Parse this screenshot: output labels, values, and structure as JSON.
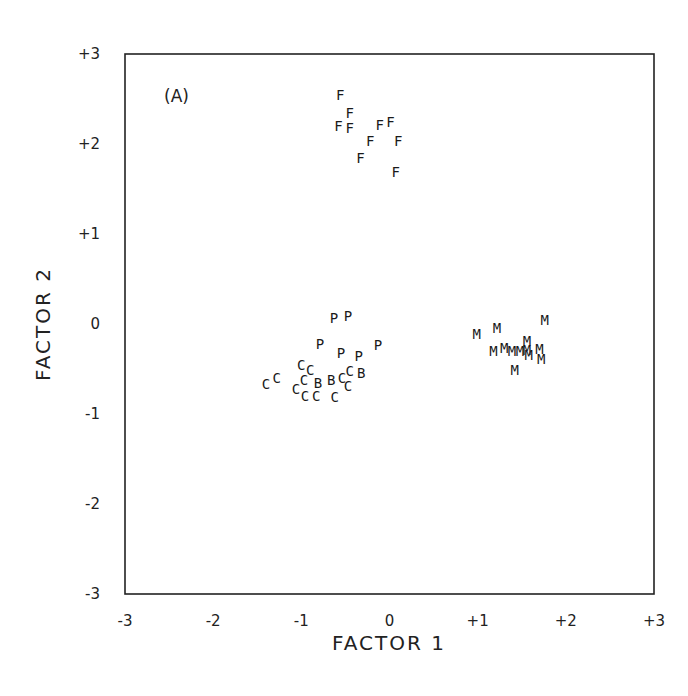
{
  "chart_data": {
    "type": "scatter",
    "title": "",
    "panel_label": "(A)",
    "xlabel": "FACTOR 1",
    "ylabel": "FACTOR 2",
    "xlim": [
      -3,
      3
    ],
    "ylim": [
      -3,
      3
    ],
    "xticks": [
      "-3",
      "-2",
      "-1",
      "0",
      "+1",
      "+2",
      "+3"
    ],
    "yticks": [
      "+3",
      "+2",
      "+1",
      "0",
      "-1",
      "-2",
      "-3"
    ],
    "grid": false,
    "legend": null,
    "marker_style": "letter",
    "series": [
      {
        "name": "F",
        "marker": "F",
        "points": [
          [
            -0.56,
            2.55
          ],
          [
            -0.45,
            2.34
          ],
          [
            -0.58,
            2.2
          ],
          [
            -0.45,
            2.18
          ],
          [
            -0.11,
            2.21
          ],
          [
            0.01,
            2.25
          ],
          [
            -0.22,
            2.03
          ],
          [
            0.1,
            2.03
          ],
          [
            -0.33,
            1.85
          ],
          [
            0.07,
            1.69
          ]
        ]
      },
      {
        "name": "P",
        "marker": "P",
        "points": [
          [
            -0.63,
            0.07
          ],
          [
            -0.47,
            0.09
          ],
          [
            -0.79,
            -0.22
          ],
          [
            -0.55,
            -0.32
          ],
          [
            -0.35,
            -0.35
          ],
          [
            -0.13,
            -0.23
          ]
        ]
      },
      {
        "name": "C",
        "marker": "C",
        "points": [
          [
            -1.4,
            -0.67
          ],
          [
            -1.28,
            -0.6
          ],
          [
            -1.0,
            -0.45
          ],
          [
            -0.9,
            -0.51
          ],
          [
            -0.97,
            -0.62
          ],
          [
            -1.06,
            -0.72
          ],
          [
            -0.96,
            -0.8
          ],
          [
            -0.83,
            -0.8
          ],
          [
            -0.54,
            -0.6
          ],
          [
            -0.47,
            -0.69
          ],
          [
            -0.45,
            -0.52
          ],
          [
            -0.62,
            -0.81
          ]
        ]
      },
      {
        "name": "B",
        "marker": "B",
        "points": [
          [
            -0.81,
            -0.65
          ],
          [
            -0.66,
            -0.62
          ],
          [
            -0.32,
            -0.54
          ]
        ]
      },
      {
        "name": "M",
        "marker": "M",
        "points": [
          [
            0.99,
            -0.11
          ],
          [
            1.22,
            -0.04
          ],
          [
            1.76,
            0.04
          ],
          [
            1.18,
            -0.3
          ],
          [
            1.3,
            -0.27
          ],
          [
            1.39,
            -0.3
          ],
          [
            1.48,
            -0.3
          ],
          [
            1.56,
            -0.29
          ],
          [
            1.56,
            -0.19
          ],
          [
            1.58,
            -0.34
          ],
          [
            1.7,
            -0.28
          ],
          [
            1.72,
            -0.39
          ],
          [
            1.42,
            -0.51
          ]
        ]
      }
    ]
  }
}
